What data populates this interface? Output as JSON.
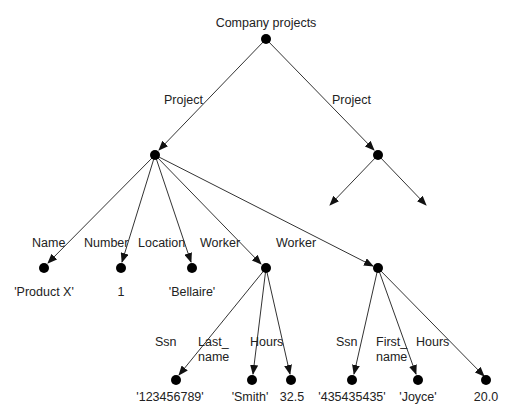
{
  "diagram": {
    "title": "Company projects",
    "edge_labels": {
      "project_left": "Project",
      "project_right": "Project",
      "name": "Name",
      "number": "Number",
      "location": "Location",
      "worker1": "Worker",
      "worker2": "Worker",
      "ssn1": "Ssn",
      "last_name_1": "Last_",
      "last_name_2": "name",
      "hours1": "Hours",
      "ssn2": "Ssn",
      "first_name_1": "First_",
      "first_name_2": "name",
      "hours2": "Hours"
    },
    "leaf_values": {
      "product": "'Product X'",
      "number": "1",
      "location": "'Bellaire'",
      "ssn1": "'123456789'",
      "last_name": "'Smith'",
      "hours1": "32.5",
      "ssn2": "'435435435'",
      "first_name": "'Joyce'",
      "hours2": "20.0"
    }
  }
}
